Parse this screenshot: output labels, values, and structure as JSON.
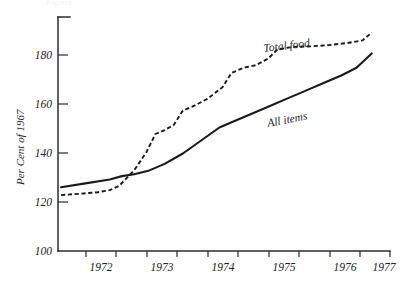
{
  "figure": {
    "name": "consumer-price-index-line-chart",
    "background_color": "#ffffff",
    "ink_color": "#1b1b1b",
    "cropped_title": "Figure"
  },
  "chart_data": {
    "type": "line",
    "title": "",
    "xlabel": "",
    "ylabel": "Per Cent of 1967",
    "xlim": [
      1971.75,
      1977.2
    ],
    "ylim": [
      100,
      190
    ],
    "grid": false,
    "legend": "inline-annotations",
    "x_ticks": [
      1972,
      1973,
      1974,
      1975,
      1976,
      1977
    ],
    "x_tick_labels": [
      "1972",
      "1973",
      "1974",
      "1975",
      "1976",
      "1977"
    ],
    "y_ticks": [
      100,
      120,
      140,
      160,
      180
    ],
    "y_tick_labels": [
      "100",
      "120",
      "140",
      "160",
      "180"
    ],
    "series": [
      {
        "name": "Total food",
        "style": "dashed",
        "label_text": "Total food",
        "x": [
          1971.8,
          1972.1,
          1972.4,
          1972.6,
          1972.75,
          1973.0,
          1973.2,
          1973.35,
          1973.5,
          1973.65,
          1973.8,
          1974.0,
          1974.2,
          1974.45,
          1974.6,
          1974.8,
          1975.0,
          1975.2,
          1975.35,
          1975.6,
          1975.9,
          1976.2,
          1976.5,
          1976.75,
          1976.9
        ],
        "values": [
          121.5,
          122.0,
          122.6,
          123.4,
          125.0,
          131.0,
          138.0,
          145.0,
          146.5,
          148.5,
          154.0,
          156.0,
          158.5,
          163.0,
          168.5,
          170.5,
          171.5,
          174.0,
          177.5,
          178.5,
          178.7,
          179.2,
          180.0,
          181.0,
          184.0
        ]
      },
      {
        "name": "All items",
        "style": "solid",
        "label_text": "All items",
        "x": [
          1971.8,
          1972.2,
          1972.6,
          1972.8,
          1973.0,
          1973.25,
          1973.5,
          1973.8,
          1974.1,
          1974.4,
          1974.6,
          1974.9,
          1975.2,
          1975.5,
          1975.8,
          1976.1,
          1976.4,
          1976.65,
          1976.9
        ],
        "values": [
          124.5,
          126.0,
          127.5,
          128.8,
          129.5,
          131.0,
          133.5,
          137.5,
          142.5,
          147.5,
          149.5,
          152.5,
          155.5,
          158.5,
          161.5,
          164.5,
          167.5,
          170.5,
          176.0
        ]
      }
    ],
    "annotations": [
      {
        "text": "Total food",
        "x": 1975.0,
        "y": 186.0
      },
      {
        "text": "All items",
        "x": 1975.45,
        "y": 163.0
      }
    ]
  }
}
